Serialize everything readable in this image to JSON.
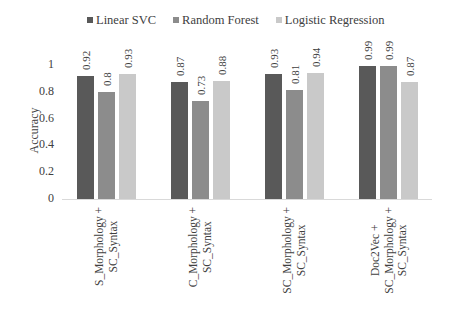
{
  "chart_data": {
    "type": "bar",
    "title": "",
    "xlabel": "",
    "ylabel": "Accuracy",
    "ylim": [
      0,
      1
    ],
    "yticks": [
      "0",
      "0.2",
      "0.4",
      "0.6",
      "0.8",
      "1"
    ],
    "grid": false,
    "legend_position": "top",
    "categories": [
      [
        "S_Morphology +",
        "SC_Syntax"
      ],
      [
        "C_Morphology +",
        "SC_Syntax"
      ],
      [
        "SC_Morphology +",
        "SC_Syntax"
      ],
      [
        "Doc2Vec +",
        "SC_Morphology +",
        "SC_Syntax"
      ]
    ],
    "series": [
      {
        "name": "Linear SVC",
        "color": "#595959",
        "values": [
          0.92,
          0.87,
          0.93,
          0.99
        ],
        "labels": [
          "0.92",
          "0.87",
          "0.93",
          "0.99"
        ]
      },
      {
        "name": "Random Forest",
        "color": "#8c8c8c",
        "values": [
          0.8,
          0.73,
          0.81,
          0.99
        ],
        "labels": [
          "0.8",
          "0.73",
          "0.81",
          "0.99"
        ]
      },
      {
        "name": "Logistic Regression",
        "color": "#c9c9c9",
        "values": [
          0.93,
          0.88,
          0.94,
          0.87
        ],
        "labels": [
          "0.93",
          "0.88",
          "0.94",
          "0.87"
        ]
      }
    ]
  }
}
